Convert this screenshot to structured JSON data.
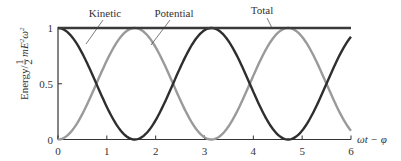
{
  "chart_data": {
    "type": "line",
    "title": "",
    "xlabel": "ωt − φ",
    "ylabel": "Energy/ ½mE²ω²",
    "xlim": [
      0,
      6
    ],
    "ylim": [
      0,
      1
    ],
    "xticks": [
      0,
      1,
      2,
      3,
      4,
      5,
      6
    ],
    "xtick_labels": [
      "0",
      "1",
      "2",
      "3",
      "4",
      "5",
      "6"
    ],
    "yticks": [
      0,
      0.5,
      1
    ],
    "ytick_labels": [
      "0",
      "0.5",
      "1"
    ],
    "grid": false,
    "legend": "inline annotations with leader lines",
    "series": [
      {
        "name": "Kinetic",
        "function": "cos^2(x)",
        "color": "#2e2e2e",
        "x": [
          0,
          0.5,
          1,
          1.5708,
          2,
          2.5,
          3,
          3.1416,
          3.5,
          4,
          4.7124,
          5,
          5.5,
          6
        ],
        "values": [
          1,
          0.77,
          0.29,
          0,
          0.17,
          0.64,
          0.98,
          1,
          0.88,
          0.43,
          0,
          0.08,
          0.5,
          0.92
        ]
      },
      {
        "name": "Potential",
        "function": "sin^2(x)",
        "color": "#9a9a9a",
        "x": [
          0,
          0.5,
          1,
          1.5708,
          2,
          2.5,
          3,
          3.1416,
          3.5,
          4,
          4.7124,
          5,
          5.5,
          6
        ],
        "values": [
          0,
          0.23,
          0.71,
          1,
          0.83,
          0.36,
          0.02,
          0,
          0.12,
          0.57,
          1,
          0.92,
          0.5,
          0.08
        ]
      },
      {
        "name": "Total",
        "function": "1",
        "color": "#3a3a3a",
        "x": [
          0,
          6
        ],
        "values": [
          1,
          1
        ]
      }
    ],
    "annotations": [
      {
        "text": "Kinetic",
        "points_to_series": "Kinetic"
      },
      {
        "text": "Potential",
        "points_to_series": "Potential"
      },
      {
        "text": "Total",
        "points_to_series": "Total"
      }
    ]
  },
  "labels": {
    "kinetic": "Kinetic",
    "potential": "Potential",
    "total": "Total",
    "xaxis": "ωt − φ",
    "yaxis_prefix": "Energy/",
    "yaxis_frac_num": "1",
    "yaxis_frac_den": "2",
    "yaxis_suffix": "mE",
    "yaxis_sup1": "2",
    "yaxis_omega": "ω",
    "yaxis_sup2": "2"
  }
}
